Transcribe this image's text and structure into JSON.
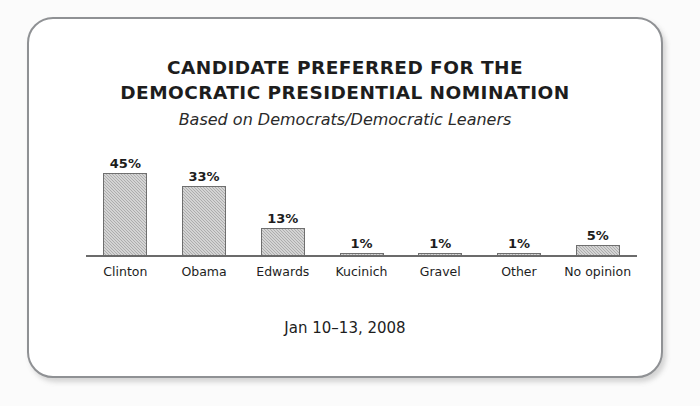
{
  "card": {
    "border_color": "#8f9194",
    "background": "#ffffff"
  },
  "chart_data": {
    "type": "bar",
    "title": "CANDIDATE PREFERRED FOR THE DEMOCRATIC PRESIDENTIAL NOMINATION",
    "title_line1": "CANDIDATE PREFERRED FOR THE",
    "title_line2": "DEMOCRATIC PRESIDENTIAL NOMINATION",
    "subtitle": "Based on Democrats/Democratic Leaners",
    "categories": [
      "Clinton",
      "Obama",
      "Edwards",
      "Kucinich",
      "Gravel",
      "Other",
      "No opinion"
    ],
    "values": [
      45,
      33,
      13,
      1,
      1,
      1,
      5
    ],
    "value_labels": [
      "45%",
      "33%",
      "13%",
      "1%",
      "1%",
      "1%",
      "5%"
    ],
    "xlabel": "",
    "ylabel": "",
    "ylim": [
      0,
      50
    ],
    "grid": false,
    "legend": false,
    "bar_color": "#adadad",
    "bar_border_color": "#6f6f6f",
    "axis_color": "#6b6b6b",
    "footnote": "Jan 10–13, 2008"
  }
}
